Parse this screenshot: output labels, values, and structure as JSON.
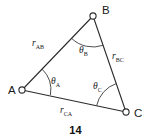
{
  "figure": {
    "caption": "14",
    "type": "triangle-diagram",
    "background_color": "#ffffff",
    "line_color": "#2b2b2b",
    "arc_color": "#3a3a3a",
    "text_color": "#1a1a1a",
    "vertices": [
      {
        "id": "A",
        "label": "A",
        "x": 22,
        "y": 90,
        "marker": "open-circle",
        "label_x": 8,
        "label_y": 94
      },
      {
        "id": "B",
        "label": "B",
        "x": 93,
        "y": 16,
        "marker": "open-circle",
        "label_x": 102,
        "label_y": 14
      },
      {
        "id": "C",
        "label": "C",
        "x": 126,
        "y": 112,
        "marker": "open-circle",
        "label_x": 134,
        "label_y": 117
      }
    ],
    "edges": [
      {
        "id": "AB",
        "from": "A",
        "to": "B",
        "label_base": "r",
        "label_sub": "AB",
        "label_x": 32,
        "label_y": 46
      },
      {
        "id": "BC",
        "from": "B",
        "to": "C",
        "label_base": "r",
        "label_sub": "BC",
        "label_x": 112,
        "label_y": 59
      },
      {
        "id": "CA",
        "from": "C",
        "to": "A",
        "label_base": "r",
        "label_sub": "CA",
        "label_x": 60,
        "label_y": 113
      }
    ],
    "angles": [
      {
        "id": "A",
        "label_base": "θ",
        "label_sub": "A",
        "label_x": 51,
        "label_y": 84,
        "arc_radius": 29
      },
      {
        "id": "B",
        "label_base": "θ",
        "label_sub": "B",
        "label_x": 79,
        "label_y": 53,
        "arc_radius": 31
      },
      {
        "id": "C",
        "label_base": "θ",
        "label_sub": "C",
        "label_x": 93,
        "label_y": 89,
        "arc_radius": 30
      }
    ]
  }
}
